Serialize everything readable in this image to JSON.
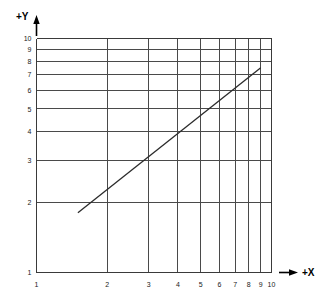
{
  "figure": {
    "kind": "log-log-grid-plot",
    "background_color": "#ffffff",
    "grid_color": "#4a4a4a",
    "frame_color": "#3a3a3a",
    "data_line_color": "#2b2b2b"
  },
  "axes": {
    "x": {
      "name": "+X",
      "arrow": "arrow-right",
      "scale": "log",
      "min": 1,
      "max": 10,
      "tick_labels": [
        "1",
        "2",
        "3",
        "4",
        "5",
        "6",
        "7",
        "8",
        "9",
        "10"
      ],
      "tick_values": [
        1,
        2,
        3,
        4,
        5,
        6,
        7,
        8,
        9,
        10
      ]
    },
    "y": {
      "name": "+Y",
      "arrow": "arrow-up",
      "scale": "log",
      "min": 1,
      "max": 10,
      "tick_labels": [
        "1",
        "2",
        "3",
        "4",
        "5",
        "6",
        "7",
        "8",
        "9",
        "10"
      ],
      "tick_values": [
        1,
        2,
        3,
        4,
        5,
        6,
        7,
        8,
        9,
        10
      ]
    }
  },
  "chart_data": {
    "type": "line",
    "title": "",
    "subtitle": "",
    "xlabel": "+X",
    "ylabel": "+Y",
    "xscale": "log",
    "yscale": "log",
    "xlim": [
      1,
      10
    ],
    "ylim": [
      1,
      10
    ],
    "grid": true,
    "legend": "none",
    "xticks": [
      1,
      2,
      3,
      4,
      5,
      6,
      7,
      8,
      9,
      10
    ],
    "xticklabels": [
      "1",
      "2",
      "3",
      "4",
      "5",
      "6",
      "7",
      "8",
      "9",
      "10"
    ],
    "yticks": [
      1,
      2,
      3,
      4,
      5,
      6,
      7,
      8,
      9,
      10
    ],
    "yticklabels": [
      "1",
      "2",
      "3",
      "4",
      "5",
      "6",
      "7",
      "8",
      "9",
      "10"
    ],
    "series": [
      {
        "name": "line",
        "style": "solid",
        "x": [
          1.5,
          9.0
        ],
        "y": [
          1.8,
          7.5
        ]
      }
    ],
    "annotations": []
  }
}
